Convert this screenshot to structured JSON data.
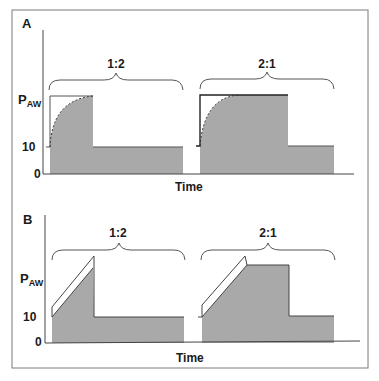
{
  "figure": {
    "panels": [
      {
        "id": "A",
        "label": "A",
        "y_axis_label_main": "P",
        "y_axis_label_sub": "AW",
        "y_ticks": [
          "10",
          "0"
        ],
        "x_axis_label": "Time",
        "waveform": "pressure-control (decelerating flow, exponential pressure rise)",
        "cycles": [
          {
            "ratio_label": "1:2"
          },
          {
            "ratio_label": "2:1"
          }
        ]
      },
      {
        "id": "B",
        "label": "B",
        "y_axis_label_main": "P",
        "y_axis_label_sub": "AW",
        "y_ticks": [
          "10",
          "0"
        ],
        "x_axis_label": "Time",
        "waveform": "volume-control (constant flow, linear pressure ramp)",
        "cycles": [
          {
            "ratio_label": "1:2"
          },
          {
            "ratio_label": "2:1"
          }
        ]
      }
    ],
    "colors": {
      "fill": "#a9a9a9",
      "line": "#333333",
      "frame": "#7a7a7a"
    }
  }
}
